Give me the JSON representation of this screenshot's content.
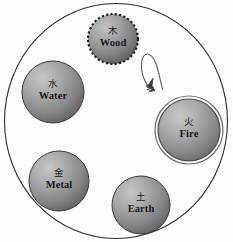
{
  "figure": {
    "background_color": "#fdfdfd",
    "outline_color": "#2b2b2b"
  },
  "outer_boundary": {
    "shape": "circle-outline",
    "cx": 116,
    "cy": 121,
    "rx": 112,
    "ry": 118,
    "stroke": "#2b2b2b",
    "stroke_width": 1
  },
  "nodes": [
    {
      "id": "wood",
      "glyph": "木",
      "label": "Wood",
      "cx": 113,
      "cy": 39,
      "r": 25,
      "border_style": "dashed",
      "ring": false,
      "fill_light": "#b9b9b9",
      "fill_dark": "#6d6d6d",
      "stroke": "#2b2b2b"
    },
    {
      "id": "fire",
      "glyph": "火",
      "label": "Fire",
      "cx": 189,
      "cy": 130,
      "r": 31,
      "border_style": "double-ring",
      "ring": true,
      "fill_light": "#bdbdbd",
      "fill_dark": "#6f6f6f",
      "stroke": "#4a4a4a"
    },
    {
      "id": "earth",
      "glyph": "土",
      "label": "Earth",
      "cx": 141,
      "cy": 205,
      "r": 29,
      "border_style": "solid",
      "ring": false,
      "fill_light": "#bbbbbb",
      "fill_dark": "#6b6b6b",
      "stroke": "#3a3a3a"
    },
    {
      "id": "metal",
      "glyph": "金",
      "label": "Metal",
      "cx": 59,
      "cy": 181,
      "r": 30,
      "border_style": "solid",
      "ring": false,
      "fill_light": "#bbbbbb",
      "fill_dark": "#6b6b6b",
      "stroke": "#3a3a3a"
    },
    {
      "id": "water",
      "glyph": "水",
      "label": "Water",
      "cx": 53,
      "cy": 92,
      "r": 31,
      "border_style": "solid",
      "ring": false,
      "fill_light": "#bbbbbb",
      "fill_dark": "#6b6b6b",
      "stroke": "#3a3a3a"
    }
  ],
  "arrow": {
    "id": "wood-to-fire-arrow",
    "from": "wood",
    "to": "fire",
    "style": "outlined-loop",
    "stroke": "#555555",
    "fill": "#ffffff",
    "head_direction": "down-left",
    "head_x": 150,
    "head_y": 84
  }
}
